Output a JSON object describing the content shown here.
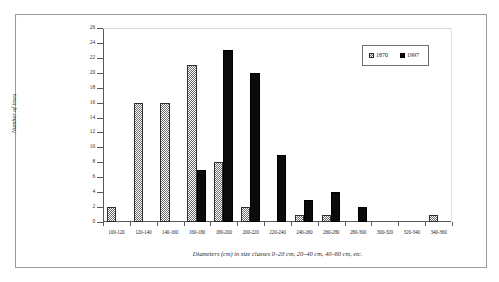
{
  "figure": {
    "y_axis_title": "Number of trees",
    "x_axis_caption": "Diameters (cm) in size classes 0–20 cm, 20–40 cm, 40–60 cm, etc."
  },
  "legend": {
    "position": "top-right",
    "entries": [
      {
        "label": "1870",
        "swatch": "hatched-checker-swatch",
        "color": "#6e6e6e"
      },
      {
        "label": "1997",
        "swatch": "solid-black-swatch",
        "color": "#0b0b0b"
      }
    ]
  },
  "chart_data": {
    "type": "bar",
    "title": "",
    "subtitle": "",
    "xlabel": "Diameters (cm) in size classes 0–20 cm, 20–40 cm, 40–60 cm, etc.",
    "ylabel": "Number of trees",
    "ylim": [
      0,
      26
    ],
    "ytick_step": 2,
    "yticks": [
      0,
      2,
      4,
      6,
      8,
      10,
      12,
      14,
      16,
      18,
      20,
      22,
      24,
      26
    ],
    "ytick_labels": [
      "0",
      "2",
      "4",
      "6",
      "8",
      "10",
      "12",
      "14",
      "16",
      "18",
      "20",
      "22",
      "24",
      "26"
    ],
    "grid": false,
    "legend_position": "top-right",
    "categories": [
      "100-120",
      "120-140",
      "140-160",
      "160-180",
      "180-200",
      "200-220",
      "220-240",
      "240-260",
      "260-280",
      "280-300",
      "300-320",
      "320-340",
      "340-360"
    ],
    "series": [
      {
        "name": "1870",
        "color": "#6e6e6e",
        "pattern": "checker",
        "values": [
          2,
          16,
          16,
          21,
          8,
          2,
          0,
          1,
          1,
          0,
          0,
          0,
          1
        ]
      },
      {
        "name": "1997",
        "color": "#0b0b0b",
        "pattern": "solid",
        "values": [
          0,
          0,
          0,
          7,
          23,
          20,
          9,
          3,
          4,
          2,
          0,
          0,
          0
        ]
      }
    ]
  }
}
